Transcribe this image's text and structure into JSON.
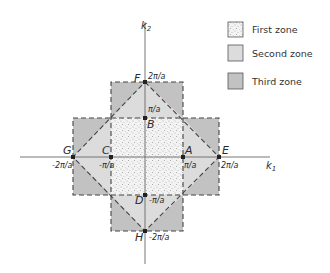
{
  "diagram": {
    "type": "brillouin-zones-2d-square-lattice",
    "axes": {
      "x_label": "k",
      "x_sub": "1",
      "y_label": "k",
      "y_sub": "2"
    },
    "points": {
      "A": {
        "label": "A",
        "value": "π/a"
      },
      "B": {
        "label": "B",
        "value": "π/a"
      },
      "C": {
        "label": "C",
        "value": "-π/a"
      },
      "D": {
        "label": "D",
        "value": "-π/a"
      },
      "E": {
        "label": "E",
        "value": "2π/a"
      },
      "F": {
        "label": "F",
        "value": "2π/a"
      },
      "G": {
        "label": "G",
        "value": "-2π/a"
      },
      "H": {
        "label": "H",
        "value": "-2π/a"
      }
    },
    "legend": [
      {
        "label": "First zone",
        "fill": "stippled"
      },
      {
        "label": "Second zone",
        "fill": "#dcdcdc"
      },
      {
        "label": "Third zone",
        "fill": "#c2c2c2"
      }
    ],
    "colors": {
      "second_zone": "#dcdcdc",
      "third_zone": "#c2c2c2",
      "first_zone_bg": "#f4f4f4",
      "line": "#444444"
    }
  }
}
